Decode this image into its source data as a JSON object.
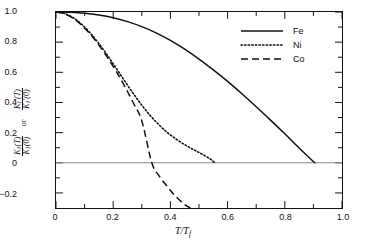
{
  "chart_data": {
    "type": "line",
    "title": "",
    "xlabel": "T/T_f",
    "ylabel": "K1(T)/K1(0) or K1'(T)/K1'(0)",
    "xlim": [
      0,
      1.0
    ],
    "ylim": [
      -0.3,
      1.0
    ],
    "xticks": [
      "0",
      "0.2",
      "0.4",
      "0.6",
      "0.8",
      "1.0"
    ],
    "xtick_values": [
      0,
      0.2,
      0.4,
      0.6,
      0.8,
      1.0
    ],
    "yticks": [
      "1.0",
      "0.8",
      "0.6",
      "0.4",
      "0.2",
      "0",
      "-0.2"
    ],
    "ytick_values": [
      1.0,
      0.8,
      0.6,
      0.4,
      0.2,
      0,
      -0.2
    ],
    "grid": false,
    "legend_position": "top-right",
    "zero_line": 0,
    "series": [
      {
        "name": "Fe",
        "style": "solid",
        "color": "#111111",
        "points": [
          [
            0.0,
            1.0
          ],
          [
            0.05,
            0.998
          ],
          [
            0.1,
            0.992
          ],
          [
            0.15,
            0.98
          ],
          [
            0.2,
            0.962
          ],
          [
            0.25,
            0.936
          ],
          [
            0.3,
            0.903
          ],
          [
            0.35,
            0.862
          ],
          [
            0.4,
            0.812
          ],
          [
            0.45,
            0.754
          ],
          [
            0.5,
            0.688
          ],
          [
            0.55,
            0.616
          ],
          [
            0.6,
            0.54
          ],
          [
            0.65,
            0.458
          ],
          [
            0.7,
            0.372
          ],
          [
            0.75,
            0.283
          ],
          [
            0.8,
            0.192
          ],
          [
            0.85,
            0.098
          ],
          [
            0.9,
            0.008
          ],
          [
            0.905,
            0.0
          ]
        ]
      },
      {
        "name": "Ni",
        "style": "dotted",
        "color": "#111111",
        "points": [
          [
            0.0,
            1.0
          ],
          [
            0.03,
            0.99
          ],
          [
            0.06,
            0.962
          ],
          [
            0.09,
            0.918
          ],
          [
            0.12,
            0.86
          ],
          [
            0.15,
            0.79
          ],
          [
            0.18,
            0.712
          ],
          [
            0.21,
            0.628
          ],
          [
            0.24,
            0.543
          ],
          [
            0.27,
            0.46
          ],
          [
            0.3,
            0.382
          ],
          [
            0.33,
            0.312
          ],
          [
            0.36,
            0.252
          ],
          [
            0.39,
            0.2
          ],
          [
            0.42,
            0.157
          ],
          [
            0.45,
            0.12
          ],
          [
            0.48,
            0.088
          ],
          [
            0.51,
            0.058
          ],
          [
            0.54,
            0.024
          ],
          [
            0.555,
            0.0
          ]
        ]
      },
      {
        "name": "Co",
        "style": "dashed",
        "color": "#111111",
        "points": [
          [
            0.0,
            1.0
          ],
          [
            0.03,
            0.988
          ],
          [
            0.06,
            0.958
          ],
          [
            0.09,
            0.912
          ],
          [
            0.12,
            0.852
          ],
          [
            0.15,
            0.78
          ],
          [
            0.18,
            0.698
          ],
          [
            0.21,
            0.608
          ],
          [
            0.24,
            0.508
          ],
          [
            0.27,
            0.398
          ],
          [
            0.3,
            0.278
          ],
          [
            0.335,
            0.0
          ],
          [
            0.36,
            -0.085
          ],
          [
            0.39,
            -0.16
          ],
          [
            0.42,
            -0.226
          ],
          [
            0.45,
            -0.278
          ],
          [
            0.47,
            -0.3
          ]
        ]
      }
    ]
  },
  "axes": {
    "x_title_main": "T/T",
    "x_title_sub": "f",
    "y_numerator_1": "K",
    "y_num_sub_1": "1",
    "y_num_arg_1": "(T)",
    "y_denominator_1": "K",
    "y_den_sub_1": "1",
    "y_den_arg_1": "(0)",
    "y_or": "or",
    "y_numerator_2": "K",
    "y_num_sub_2": "1",
    "y_num_arg_2": "(T)",
    "y_denominator_2": "K",
    "y_den_sub_2": "1",
    "y_den_arg_2": "(0)"
  },
  "legend": {
    "items": [
      {
        "label": "Fe",
        "style": "solid"
      },
      {
        "label": "Ni",
        "style": "dotted"
      },
      {
        "label": "Co",
        "style": "dashed"
      }
    ]
  }
}
